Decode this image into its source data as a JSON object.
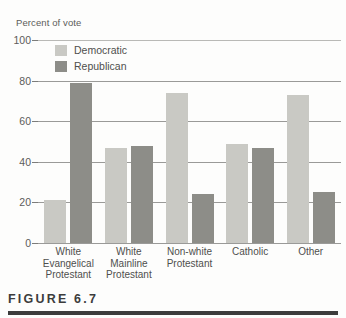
{
  "figure": {
    "caption": "FIGURE 6.7"
  },
  "chart_data": {
    "type": "bar",
    "title": "",
    "xlabel": "",
    "ylabel": "Percent of vote",
    "ylim": [
      0,
      100
    ],
    "yticks": [
      0,
      20,
      40,
      60,
      80,
      100
    ],
    "ytick_labels": [
      "0",
      "20",
      "40",
      "60",
      "80",
      "100"
    ],
    "grid": true,
    "grid_axis": "y",
    "legend_position": "upper-left-inside",
    "categories": [
      "White Evangelical Protestant",
      "White Mainline Protestant",
      "Non-white Protestant",
      "Catholic",
      "Other"
    ],
    "category_lines": [
      [
        "White",
        "Evangelical",
        "Protestant"
      ],
      [
        "White",
        "Mainline",
        "Protestant"
      ],
      [
        "Non-white",
        "Protestant"
      ],
      [
        "Catholic"
      ],
      [
        "Other"
      ]
    ],
    "series": [
      {
        "name": "Democratic",
        "color": "#c9c9c4",
        "values": [
          21,
          47,
          74,
          49,
          73
        ]
      },
      {
        "name": "Republican",
        "color": "#8d8d88",
        "values": [
          79,
          48,
          24,
          47,
          25
        ]
      }
    ]
  }
}
